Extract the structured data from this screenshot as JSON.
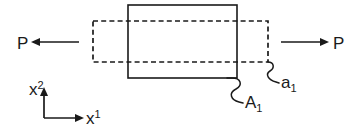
{
  "figure": {
    "background_color": "#ffffff",
    "line_color": "#1a1a1a",
    "width": 360,
    "height": 135
  },
  "shapes": {
    "solid_block": {
      "name": "reference-configuration-block",
      "x": 128,
      "y": 5,
      "width": 109,
      "height": 73,
      "style": "solid"
    },
    "dashed_block": {
      "name": "deformed-configuration-block",
      "x": 93,
      "y": 21,
      "width": 175,
      "height": 41,
      "style": "dashed"
    }
  },
  "loads": {
    "left": {
      "label": "P",
      "label_x": 17,
      "label_y": 49,
      "arrow_from_x": 79,
      "arrow_to_x": 31,
      "arrow_y": 42,
      "direction": "left"
    },
    "right": {
      "label": "P",
      "label_x": 333,
      "label_y": 49,
      "arrow_from_x": 281,
      "arrow_to_x": 329,
      "arrow_y": 42,
      "direction": "right"
    }
  },
  "annotations": [
    {
      "name": "area-a1-callout",
      "base": "a",
      "subscript": "1",
      "label_x": 280,
      "label_y": 88,
      "leader_start_x": 268,
      "leader_start_y": 62,
      "leader_end_x": 278,
      "leader_end_y": 84
    },
    {
      "name": "area-A1-callout",
      "base": "A",
      "subscript": "1",
      "label_x": 238,
      "label_y": 108,
      "leader_start_x": 236,
      "leader_start_y": 78,
      "leader_end_x": 236,
      "leader_end_y": 103
    }
  ],
  "axes": {
    "origin_x": 44,
    "origin_y": 118,
    "vertical": {
      "base": "x",
      "superscript": "2",
      "tip_x": 44,
      "tip_y": 87,
      "label_x": 29,
      "label_y": 95
    },
    "horizontal": {
      "base": "x",
      "superscript": "1",
      "tip_x": 84,
      "tip_y": 118,
      "label_x": 85,
      "label_y": 124
    }
  }
}
